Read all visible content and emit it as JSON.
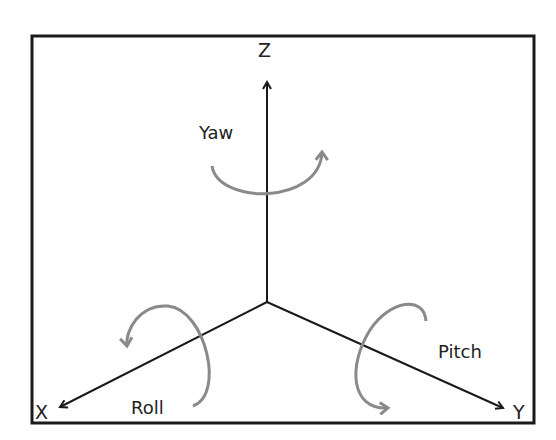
{
  "diagram": {
    "axes": {
      "x_label": "X",
      "y_label": "Y",
      "z_label": "Z"
    },
    "rotations": {
      "yaw_label": "Yaw",
      "roll_label": "Roll",
      "pitch_label": "Pitch"
    },
    "colors": {
      "axis": "#1a1a1a",
      "rotation_arrow": "#8a8a8a",
      "border": "#1a1a1a"
    }
  }
}
